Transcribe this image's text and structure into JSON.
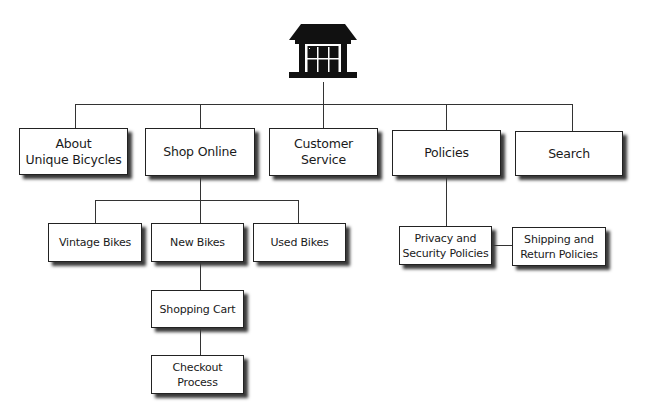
{
  "diagram": {
    "type": "sitemap",
    "root": {
      "icon": "building-home-icon"
    },
    "level1": [
      {
        "id": "about",
        "lines": [
          "About",
          "Unique Bicycles"
        ]
      },
      {
        "id": "shop-online",
        "lines": [
          "Shop Online"
        ]
      },
      {
        "id": "customer-service",
        "lines": [
          "Customer",
          "Service"
        ]
      },
      {
        "id": "policies",
        "lines": [
          "Policies"
        ]
      },
      {
        "id": "search",
        "lines": [
          "Search"
        ]
      }
    ],
    "shop_children": [
      {
        "id": "vintage-bikes",
        "lines": [
          "Vintage Bikes"
        ]
      },
      {
        "id": "new-bikes",
        "lines": [
          "New Bikes"
        ]
      },
      {
        "id": "used-bikes",
        "lines": [
          "Used Bikes"
        ]
      }
    ],
    "new_bikes_chain": [
      {
        "id": "shopping-cart",
        "lines": [
          "Shopping Cart"
        ]
      },
      {
        "id": "checkout-process",
        "lines": [
          "Checkout",
          "Process"
        ]
      }
    ],
    "policies_children": [
      {
        "id": "privacy-security",
        "lines": [
          "Privacy and",
          "Security Policies"
        ]
      },
      {
        "id": "shipping-return",
        "lines": [
          "Shipping and",
          "Return Policies"
        ]
      }
    ],
    "colors": {
      "line": "#333333",
      "box_border": "#222222",
      "shadow": "#3a3a3a",
      "icon": "#111111"
    }
  }
}
